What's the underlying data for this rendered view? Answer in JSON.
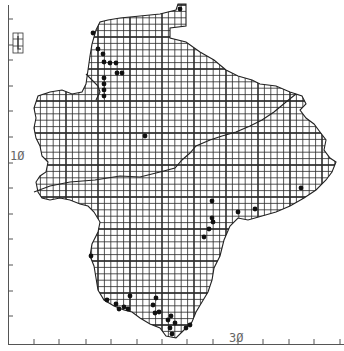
{
  "map": {
    "type": "distribution-grid-map",
    "background": "#ffffff",
    "grid_color": "#333333",
    "outline_color": "#222222",
    "dot_color": "#111111",
    "cell_size_px": 6.4,
    "axis": {
      "left_label": "1Ø",
      "bottom_label": "3Ø",
      "left_label_pos": {
        "x": 10,
        "y": 150
      },
      "bottom_label_pos": {
        "x": 229,
        "y": 333
      }
    },
    "bottom_ticks_x": [
      34,
      59,
      86,
      111,
      137,
      162,
      187,
      213,
      238,
      263,
      289,
      314,
      340
    ],
    "left_ticks_y": [
      19,
      45,
      60,
      86,
      111,
      137,
      163,
      188,
      214,
      239,
      265,
      291,
      316
    ],
    "record_dots": [
      [
        180,
        9
      ],
      [
        93,
        33
      ],
      [
        98,
        49
      ],
      [
        103,
        54
      ],
      [
        104,
        62
      ],
      [
        110,
        63
      ],
      [
        116,
        63
      ],
      [
        117,
        73
      ],
      [
        122,
        73
      ],
      [
        104,
        78
      ],
      [
        104,
        84
      ],
      [
        104,
        90
      ],
      [
        104,
        96
      ],
      [
        145,
        136
      ],
      [
        301,
        188
      ],
      [
        212,
        201
      ],
      [
        212,
        218
      ],
      [
        213,
        222
      ],
      [
        238,
        212
      ],
      [
        255,
        209
      ],
      [
        209,
        229
      ],
      [
        204,
        237
      ],
      [
        91,
        256
      ],
      [
        107,
        300
      ],
      [
        116,
        304
      ],
      [
        119,
        309
      ],
      [
        124,
        307
      ],
      [
        128,
        309
      ],
      [
        130,
        296
      ],
      [
        155,
        313
      ],
      [
        159,
        312
      ],
      [
        168,
        320
      ],
      [
        171,
        316
      ],
      [
        175,
        323
      ],
      [
        170,
        328
      ],
      [
        172,
        334
      ],
      [
        186,
        328
      ],
      [
        190,
        325
      ],
      [
        153,
        305
      ],
      [
        156,
        298
      ]
    ]
  }
}
